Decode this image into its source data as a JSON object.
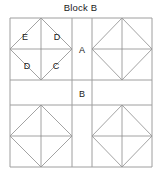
{
  "title": "Block B",
  "diagram": {
    "name": "quilt-block-diagram",
    "line_color": "#808080",
    "border_color": "#9a9a9a",
    "background_color": "#ffffff",
    "label_color": "#1a1a1a",
    "grid": {
      "columns": 3,
      "rows": 3,
      "x_lines": [
        10,
        72,
        92,
        152
      ],
      "y_lines": [
        18,
        80,
        105,
        167
      ]
    },
    "cells": [
      {
        "id": "cell-top-left",
        "row": 0,
        "col": 0,
        "pattern": "diamond-star",
        "label": ""
      },
      {
        "id": "cell-top-center",
        "row": 0,
        "col": 1,
        "pattern": "plain",
        "label": "A"
      },
      {
        "id": "cell-top-right",
        "row": 0,
        "col": 2,
        "pattern": "diamond-star",
        "label": ""
      },
      {
        "id": "cell-middle-left",
        "row": 1,
        "col": 0,
        "pattern": "plain",
        "label": ""
      },
      {
        "id": "cell-middle-center",
        "row": 1,
        "col": 1,
        "pattern": "plain",
        "label": "B"
      },
      {
        "id": "cell-middle-right",
        "row": 1,
        "col": 2,
        "pattern": "plain",
        "label": ""
      },
      {
        "id": "cell-bottom-left",
        "row": 2,
        "col": 0,
        "pattern": "diamond-star",
        "label": ""
      },
      {
        "id": "cell-bottom-center",
        "row": 2,
        "col": 1,
        "pattern": "plain",
        "label": ""
      },
      {
        "id": "cell-bottom-right",
        "row": 2,
        "col": 2,
        "pattern": "diamond-star",
        "label": ""
      }
    ],
    "labels": [
      {
        "id": "label-E",
        "text": "E",
        "x": 25,
        "y": 37
      },
      {
        "id": "label-D-top",
        "text": "D",
        "x": 51,
        "y": 37
      },
      {
        "id": "label-D-bottom",
        "text": "D",
        "x": 25,
        "y": 66
      },
      {
        "id": "label-C",
        "text": "C",
        "x": 52,
        "y": 66
      },
      {
        "id": "label-A",
        "text": "A",
        "x": 79,
        "y": 52
      },
      {
        "id": "label-B",
        "text": "B",
        "x": 79,
        "y": 96
      }
    ]
  }
}
